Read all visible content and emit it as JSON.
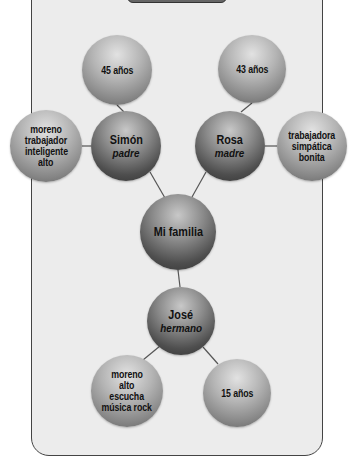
{
  "diagram": {
    "center": {
      "label": "Mi familia"
    },
    "members": [
      {
        "name": "Simón",
        "role": "padre",
        "age": "45 años",
        "traits": [
          "moreno",
          "trabajador",
          "inteligente",
          "alto"
        ]
      },
      {
        "name": "Rosa",
        "role": "madre",
        "age": "43 años",
        "traits": [
          "trabajadora",
          "simpática",
          "bonita"
        ]
      },
      {
        "name": "José",
        "role": "hermano",
        "age": "15 años",
        "traits": [
          "moreno",
          "alto",
          "escucha",
          "música rock"
        ]
      }
    ]
  }
}
